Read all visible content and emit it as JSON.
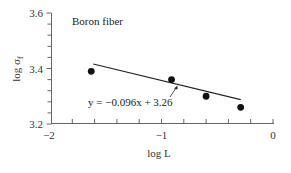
{
  "chart_data": {
    "type": "scatter",
    "title": "",
    "annotation_title": "Boron fiber",
    "xlabel": "log L",
    "ylabel": "log σ",
    "ylabel_subscript": "f",
    "xlim": [
      -2,
      0
    ],
    "ylim": [
      3.2,
      3.6
    ],
    "x_ticks": [
      -2,
      -1,
      0
    ],
    "x_tick_labels": [
      "−2",
      "−1",
      "0"
    ],
    "y_ticks": [
      3.2,
      3.4,
      3.6
    ],
    "y_tick_labels": [
      "3.2",
      "3.4",
      "3.6"
    ],
    "grid": false,
    "legend": null,
    "series": [
      {
        "name": "Boron fiber data",
        "type": "scatter",
        "x": [
          -1.63,
          -0.91,
          -0.6,
          -0.29
        ],
        "y": [
          3.39,
          3.36,
          3.3,
          3.26
        ]
      },
      {
        "name": "Linear fit",
        "type": "line",
        "equation": "y = −0.096x + 3.26",
        "slope": -0.096,
        "intercept": 3.26,
        "x_range": [
          -1.63,
          -0.29
        ]
      }
    ],
    "annotations": [
      {
        "text": "Boron fiber"
      },
      {
        "text": "y = −0.096x + 3.26",
        "arrow_to": "fit line"
      }
    ]
  }
}
